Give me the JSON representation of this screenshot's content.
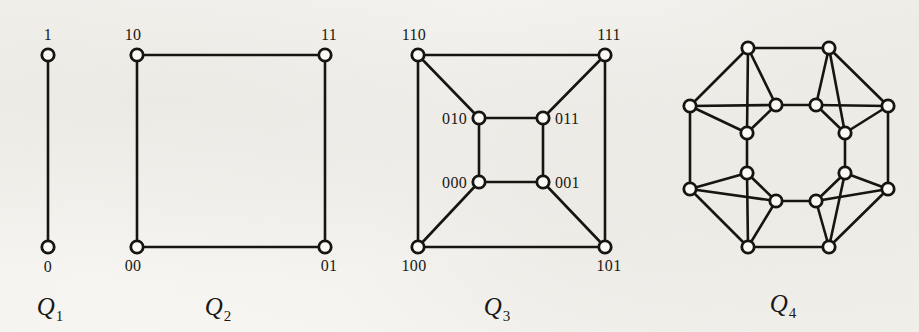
{
  "figure": {
    "background_color": "#f7f6f3",
    "ink_color": "#17150f",
    "vertex_fill": "#fbfaf7"
  },
  "graphs": [
    {
      "id": "q1",
      "caption_letter": "Q",
      "caption_sub": "1",
      "caption_x": 50,
      "caption_y": 315,
      "dimension": 1,
      "vertex_count": 2,
      "edge_count": 1,
      "vertices": [
        {
          "label": "1",
          "x": 48,
          "y": 55,
          "label_x": 48,
          "label_y": 40,
          "label_anchor": "middle"
        },
        {
          "label": "0",
          "x": 48,
          "y": 247,
          "label_x": 48,
          "label_y": 272,
          "label_anchor": "middle"
        }
      ],
      "edges": [
        [
          0,
          1
        ]
      ]
    },
    {
      "id": "q2",
      "caption_letter": "Q",
      "caption_sub": "2",
      "caption_x": 218,
      "caption_y": 315,
      "dimension": 2,
      "vertex_count": 4,
      "edge_count": 4,
      "vertices": [
        {
          "label": "10",
          "x": 137,
          "y": 55,
          "label_x": 133,
          "label_y": 40,
          "label_anchor": "middle"
        },
        {
          "label": "11",
          "x": 325,
          "y": 55,
          "label_x": 329,
          "label_y": 40,
          "label_anchor": "middle"
        },
        {
          "label": "00",
          "x": 137,
          "y": 247,
          "label_x": 133,
          "label_y": 271,
          "label_anchor": "middle"
        },
        {
          "label": "01",
          "x": 325,
          "y": 247,
          "label_x": 329,
          "label_y": 271,
          "label_anchor": "middle"
        }
      ],
      "edges": [
        [
          0,
          1
        ],
        [
          0,
          2
        ],
        [
          1,
          3
        ],
        [
          2,
          3
        ]
      ]
    },
    {
      "id": "q3",
      "caption_letter": "Q",
      "caption_sub": "3",
      "caption_x": 497,
      "caption_y": 315,
      "dimension": 3,
      "vertex_count": 8,
      "edge_count": 12,
      "vertices": [
        {
          "label": "110",
          "x": 418,
          "y": 55,
          "label_x": 414,
          "label_y": 40,
          "label_anchor": "middle"
        },
        {
          "label": "111",
          "x": 605,
          "y": 55,
          "label_x": 609,
          "label_y": 40,
          "label_anchor": "middle"
        },
        {
          "label": "100",
          "x": 418,
          "y": 247,
          "label_x": 414,
          "label_y": 271,
          "label_anchor": "middle"
        },
        {
          "label": "101",
          "x": 605,
          "y": 247,
          "label_x": 609,
          "label_y": 271,
          "label_anchor": "middle"
        },
        {
          "label": "010",
          "x": 479,
          "y": 118,
          "label_x": 467,
          "label_y": 124,
          "label_anchor": "end"
        },
        {
          "label": "011",
          "x": 543,
          "y": 118,
          "label_x": 555,
          "label_y": 124,
          "label_anchor": "start"
        },
        {
          "label": "000",
          "x": 479,
          "y": 182,
          "label_x": 467,
          "label_y": 188,
          "label_anchor": "end"
        },
        {
          "label": "001",
          "x": 543,
          "y": 182,
          "label_x": 555,
          "label_y": 188,
          "label_anchor": "start"
        }
      ],
      "edges": [
        [
          0,
          1
        ],
        [
          0,
          2
        ],
        [
          1,
          3
        ],
        [
          2,
          3
        ],
        [
          4,
          5
        ],
        [
          4,
          6
        ],
        [
          5,
          7
        ],
        [
          6,
          7
        ],
        [
          0,
          4
        ],
        [
          1,
          5
        ],
        [
          2,
          6
        ],
        [
          3,
          7
        ]
      ]
    },
    {
      "id": "q4",
      "caption_letter": "Q",
      "caption_sub": "4",
      "caption_x": 783,
      "caption_y": 312,
      "dimension": 4,
      "vertex_count": 16,
      "edge_count": 32,
      "vertices": [
        {
          "label": "",
          "x": 748,
          "y": 48
        },
        {
          "label": "",
          "x": 829,
          "y": 48
        },
        {
          "label": "",
          "x": 690,
          "y": 106
        },
        {
          "label": "",
          "x": 888,
          "y": 106
        },
        {
          "label": "",
          "x": 690,
          "y": 189
        },
        {
          "label": "",
          "x": 888,
          "y": 189
        },
        {
          "label": "",
          "x": 748,
          "y": 247
        },
        {
          "label": "",
          "x": 829,
          "y": 247
        },
        {
          "label": "",
          "x": 776,
          "y": 105
        },
        {
          "label": "",
          "x": 816,
          "y": 105
        },
        {
          "label": "",
          "x": 747,
          "y": 133
        },
        {
          "label": "",
          "x": 845,
          "y": 133
        },
        {
          "label": "",
          "x": 747,
          "y": 173
        },
        {
          "label": "",
          "x": 845,
          "y": 173
        },
        {
          "label": "",
          "x": 776,
          "y": 201
        },
        {
          "label": "",
          "x": 816,
          "y": 201
        }
      ],
      "edges": [
        [
          0,
          1
        ],
        [
          0,
          2
        ],
        [
          1,
          3
        ],
        [
          2,
          4
        ],
        [
          3,
          5
        ],
        [
          4,
          6
        ],
        [
          5,
          7
        ],
        [
          6,
          7
        ],
        [
          8,
          9
        ],
        [
          8,
          10
        ],
        [
          9,
          11
        ],
        [
          10,
          12
        ],
        [
          11,
          13
        ],
        [
          12,
          14
        ],
        [
          13,
          15
        ],
        [
          14,
          15
        ],
        [
          0,
          8
        ],
        [
          1,
          9
        ],
        [
          2,
          10
        ],
        [
          3,
          11
        ],
        [
          4,
          12
        ],
        [
          5,
          13
        ],
        [
          6,
          14
        ],
        [
          7,
          15
        ],
        [
          0,
          10
        ],
        [
          1,
          11
        ],
        [
          2,
          8
        ],
        [
          3,
          9
        ],
        [
          4,
          14
        ],
        [
          5,
          15
        ],
        [
          6,
          12
        ],
        [
          7,
          13
        ]
      ]
    }
  ]
}
